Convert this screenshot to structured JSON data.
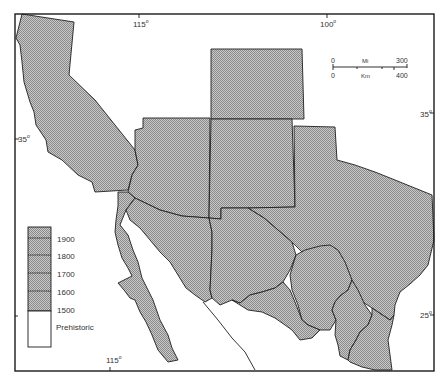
{
  "map": {
    "title": "",
    "fill_color": "#b8b8b8",
    "stroke_color": "#1f1f1f",
    "background": "#ffffff"
  },
  "graticule": {
    "top_longitudes": [
      {
        "label": "115°",
        "value": "115",
        "suffix": "o"
      },
      {
        "label": "100°",
        "value": "100",
        "suffix": "o"
      }
    ],
    "bottom_longitudes": [
      {
        "label": "115°",
        "value": "115",
        "suffix": "o"
      }
    ],
    "left_latitudes": [
      {
        "label": "35°",
        "value": "35",
        "suffix": "o"
      }
    ],
    "right_latitudes": [
      {
        "label": "35°",
        "value": "35",
        "suffix": "o"
      },
      {
        "label": "25°",
        "value": "25",
        "suffix": "o"
      }
    ]
  },
  "scale_bar": {
    "miles": {
      "start": "0",
      "unit": "Mi",
      "end": "300"
    },
    "km": {
      "start": "0",
      "unit": "Km",
      "end": "400"
    }
  },
  "legend": {
    "entries": [
      {
        "label": "1900",
        "shaded": true
      },
      {
        "label": "1800",
        "shaded": true
      },
      {
        "label": "1700",
        "shaded": true
      },
      {
        "label": "1600",
        "shaded": true
      },
      {
        "label": "1500",
        "shaded": true
      },
      {
        "label": "Prehistoric",
        "shaded": false
      }
    ]
  },
  "regions": [
    {
      "name": "California"
    },
    {
      "name": "Arizona"
    },
    {
      "name": "Colorado"
    },
    {
      "name": "New Mexico"
    },
    {
      "name": "Texas"
    },
    {
      "name": "Baja California"
    },
    {
      "name": "Sonora"
    },
    {
      "name": "Chihuahua"
    },
    {
      "name": "Coahuila"
    },
    {
      "name": "Nuevo Leon"
    },
    {
      "name": "Tamaulipas"
    },
    {
      "name": "Sinaloa"
    }
  ]
}
